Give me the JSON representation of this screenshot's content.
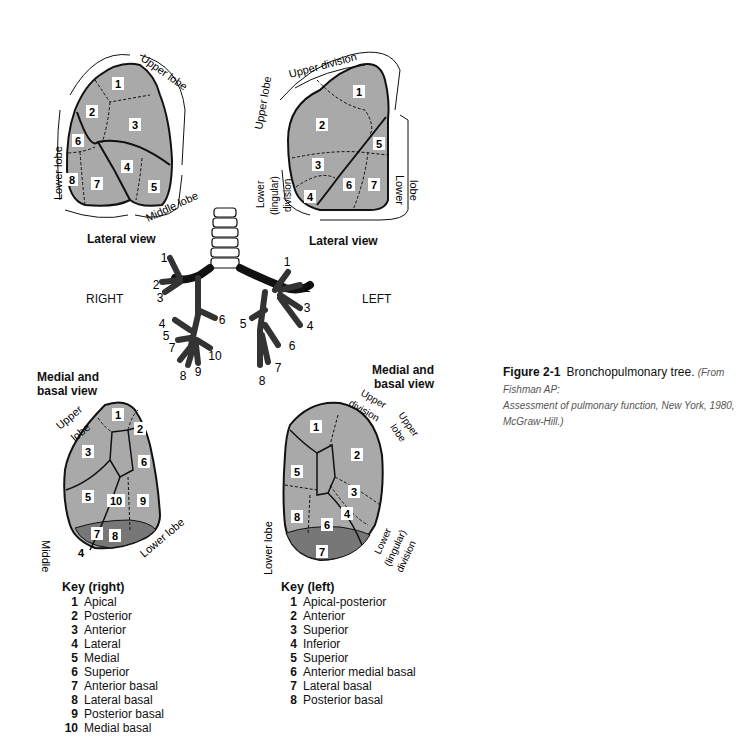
{
  "figure": {
    "number": "Figure 2-1",
    "title": "Bronchopulmonary tree.",
    "source": "(From Fishman AP: Assessment of pulmonary function, New York, 1980, McGraw-Hill.)",
    "source_line1": "(From Fishman AP:",
    "source_line2": "Assessment of pulmonary function, New York, 1980, McGraw-Hill.)"
  },
  "colors": {
    "lung_fill": "#a9a9a9",
    "outline": "#111111",
    "background": "#ffffff"
  },
  "sides": {
    "right": "RIGHT",
    "left": "LEFT"
  },
  "views": {
    "right_lateral": {
      "caption": "Lateral view",
      "labels": [
        "Upper lobe",
        "Lower lobe",
        "Middle lobe"
      ],
      "segments": [
        "1",
        "2",
        "3",
        "4",
        "5",
        "6",
        "7",
        "8"
      ]
    },
    "left_lateral": {
      "caption": "Lateral view",
      "labels": [
        "Upper lobe",
        "Upper division",
        "Lower (lingular) division",
        "Lower lobe"
      ],
      "segments": [
        "1",
        "2",
        "3",
        "4",
        "5",
        "6",
        "7"
      ]
    },
    "right_medial": {
      "caption_line1": "Medial and",
      "caption_line2": "basal view",
      "labels": [
        "Upper lobe",
        "Middle lobe",
        "Lower lobe",
        "4"
      ],
      "segments": [
        "1",
        "2",
        "3",
        "5",
        "6",
        "7",
        "8",
        "9",
        "10"
      ]
    },
    "left_medial": {
      "caption_line1": "Medial and",
      "caption_line2": "basal view",
      "labels": [
        "Upper division",
        "Upper lobe",
        "Lower (lingular) division",
        "Lower lobe"
      ],
      "segments": [
        "1",
        "2",
        "3",
        "4",
        "5",
        "6",
        "7",
        "8"
      ]
    }
  },
  "tree": {
    "right_numbers": [
      "1",
      "2",
      "3",
      "4",
      "5",
      "6",
      "7",
      "8",
      "9",
      "10"
    ],
    "left_numbers": [
      "1",
      "2",
      "3",
      "4",
      "5",
      "6",
      "7",
      "8"
    ]
  },
  "key_right": {
    "title": "Key (right)",
    "items": [
      {
        "n": "1",
        "label": "Apical"
      },
      {
        "n": "2",
        "label": "Posterior"
      },
      {
        "n": "3",
        "label": "Anterior"
      },
      {
        "n": "4",
        "label": "Lateral"
      },
      {
        "n": "5",
        "label": "Medial"
      },
      {
        "n": "6",
        "label": "Superior"
      },
      {
        "n": "7",
        "label": "Anterior basal"
      },
      {
        "n": "8",
        "label": "Lateral basal"
      },
      {
        "n": "9",
        "label": "Posterior basal"
      },
      {
        "n": "10",
        "label": "Medial basal"
      }
    ]
  },
  "key_left": {
    "title": "Key (left)",
    "items": [
      {
        "n": "1",
        "label": "Apical-posterior"
      },
      {
        "n": "2",
        "label": "Anterior"
      },
      {
        "n": "3",
        "label": "Superior"
      },
      {
        "n": "4",
        "label": "Inferior"
      },
      {
        "n": "5",
        "label": "Superior"
      },
      {
        "n": "6",
        "label": "Anterior medial basal"
      },
      {
        "n": "7",
        "label": "Lateral basal"
      },
      {
        "n": "8",
        "label": "Posterior basal"
      }
    ]
  }
}
